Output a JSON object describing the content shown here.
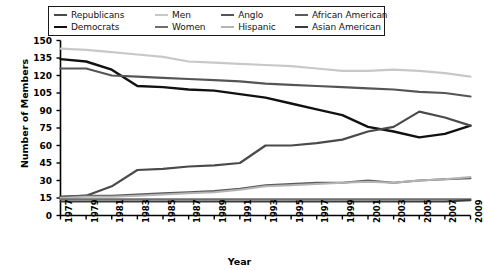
{
  "legend": {
    "items": [
      {
        "label": "Republicans",
        "color": "#4a4a4a",
        "column": 1,
        "row": 1
      },
      {
        "label": "Democrats",
        "color": "#111111",
        "column": 1,
        "row": 2
      },
      {
        "label": "Men",
        "color": "#c8c8c8",
        "column": 2,
        "row": 1
      },
      {
        "label": "Women",
        "color": "#6e6e6e",
        "column": 2,
        "row": 2
      },
      {
        "label": "Anglo",
        "color": "#555555",
        "column": 3,
        "row": 1
      },
      {
        "label": "Hispanic",
        "color": "#b4b4b4",
        "column": 3,
        "row": 2
      },
      {
        "label": "African American",
        "color": "#5a5a5a",
        "column": 4,
        "row": 1
      },
      {
        "label": "Asian American",
        "color": "#3c3c3c",
        "column": 4,
        "row": 2
      }
    ]
  },
  "chart_data": {
    "type": "line",
    "title": "",
    "xlabel": "Year",
    "ylabel": "Number of Members",
    "xlim": [
      1977,
      2009
    ],
    "ylim": [
      0,
      150
    ],
    "yticks": [
      0,
      15,
      30,
      45,
      60,
      75,
      90,
      105,
      120,
      135,
      150
    ],
    "grid": false,
    "legend_position": "top",
    "x": [
      1977,
      1979,
      1981,
      1983,
      1985,
      1987,
      1989,
      1991,
      1993,
      1995,
      1997,
      1999,
      2001,
      2003,
      2005,
      2007,
      2009
    ],
    "xticklabels": [
      "1977",
      "1979",
      "1981",
      "1983",
      "1985",
      "1987",
      "1989",
      "1991",
      "1993",
      "1995",
      "1997",
      "1999",
      "2001",
      "2003",
      "2005",
      "2007",
      "2009"
    ],
    "series": [
      {
        "name": "Men",
        "color": "#c8c8c8",
        "width": 2.2,
        "values": [
          143,
          142,
          140,
          138,
          136,
          132,
          131,
          130,
          129,
          128,
          126,
          124,
          124,
          125,
          124,
          122,
          119
        ]
      },
      {
        "name": "Democrats",
        "color": "#111111",
        "width": 2.4,
        "values": [
          134,
          132,
          125,
          111,
          110,
          108,
          107,
          104,
          101,
          96,
          91,
          86,
          76,
          72,
          67,
          70,
          77
        ]
      },
      {
        "name": "Anglo",
        "color": "#555555",
        "width": 2.2,
        "values": [
          126,
          126,
          120,
          119,
          118,
          117,
          116,
          115,
          113,
          112,
          111,
          110,
          109,
          108,
          106,
          105,
          102
        ]
      },
      {
        "name": "Republicans",
        "color": "#4a4a4a",
        "width": 2.2,
        "values": [
          16,
          17,
          25,
          39,
          40,
          42,
          43,
          45,
          60,
          60,
          62,
          65,
          72,
          76,
          89,
          84,
          77
        ]
      },
      {
        "name": "African American",
        "color": "#5a5a5a",
        "width": 2.0,
        "values": [
          16,
          17,
          17,
          18,
          19,
          20,
          21,
          23,
          26,
          27,
          28,
          28,
          30,
          28,
          30,
          31,
          32
        ]
      },
      {
        "name": "Hispanic",
        "color": "#b4b4b4",
        "width": 2.0,
        "values": [
          15,
          16,
          16,
          17,
          18,
          19,
          20,
          22,
          25,
          26,
          27,
          28,
          29,
          28,
          30,
          31,
          33
        ]
      },
      {
        "name": "Women",
        "color": "#6e6e6e",
        "width": 2.0,
        "values": [
          14,
          14,
          14,
          14,
          14,
          14,
          14,
          14,
          14,
          14,
          14,
          14,
          14,
          14,
          14,
          14,
          14
        ]
      },
      {
        "name": "Asian American",
        "color": "#3c3c3c",
        "width": 2.0,
        "values": [
          12,
          12,
          12,
          12,
          12,
          12,
          12,
          12,
          12,
          12,
          12,
          12,
          12,
          12,
          12,
          12,
          13
        ]
      }
    ]
  }
}
